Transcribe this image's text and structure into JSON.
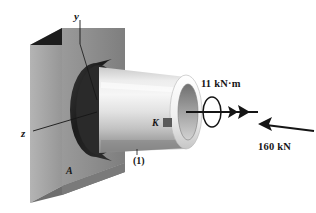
{
  "figure": {
    "background_color": "#ffffff"
  },
  "axes": {
    "y_label": "y",
    "z_label": "z"
  },
  "points": {
    "wall_point_label": "A",
    "tube_point_label": "K"
  },
  "members": {
    "tube_label": "(1)"
  },
  "loads": {
    "torque_label": "11 kN·m",
    "force_label": "160 kN"
  },
  "colors": {
    "wall_front": "#8c8c8c",
    "wall_side": "#a8a8a8",
    "wall_top": "#1d1d1d",
    "collar_dark": "#262626",
    "tube_light": "#f2f2f2",
    "tube_mid": "#cfcfcf",
    "tube_shadow": "#8f8f8f",
    "line_color": "#151515",
    "marker_color": "#555555"
  }
}
